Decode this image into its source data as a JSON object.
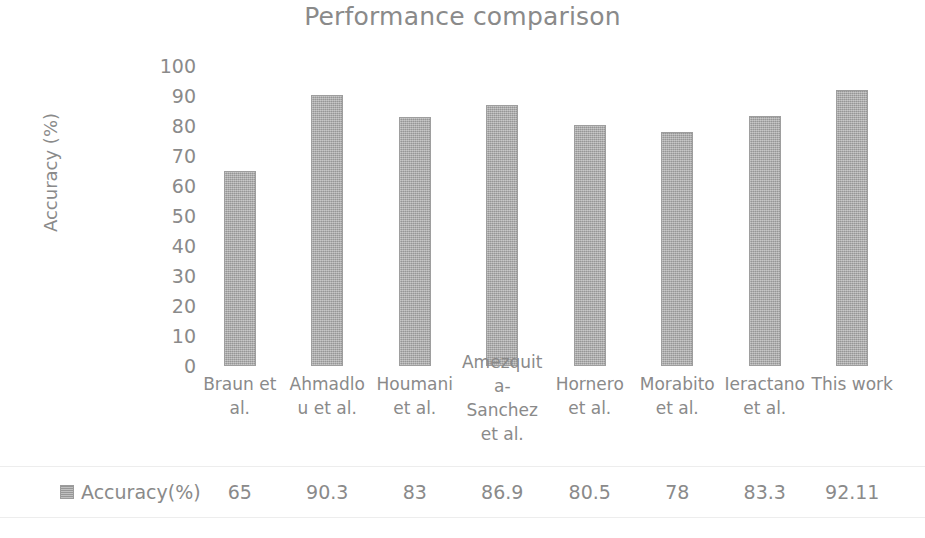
{
  "chart_data": {
    "type": "bar",
    "title": "Performance comparison",
    "xlabel": "",
    "ylabel": "Accuracy (%)",
    "ylim": [
      0,
      100
    ],
    "ytick_step": 10,
    "yticks": [
      "100",
      "90",
      "80",
      "70",
      "60",
      "50",
      "40",
      "30",
      "20",
      "10",
      "0"
    ],
    "grid": false,
    "legend_position": "bottom",
    "categories": [
      "Braun et al.",
      "Ahmadlou et al.",
      "Houmani et al.",
      "Amezquita-Sanchez et al.",
      "Hornero et al.",
      "Morabito et al.",
      "Ieractano et al.",
      "This work"
    ],
    "values": [
      65,
      90.3,
      83,
      86.9,
      80.5,
      78,
      83.3,
      92.11
    ],
    "value_labels": [
      "65",
      "90.3",
      "83",
      "86.9",
      "80.5",
      "78",
      "83.3",
      "92.11"
    ],
    "series": [
      {
        "name": "Accuracy(%)",
        "values": [
          65,
          90.3,
          83,
          86.9,
          80.5,
          78,
          83.3,
          92.11
        ]
      }
    ],
    "colors": {
      "bar_fill": "#ababab",
      "bar_border": "#9e9e9e",
      "text": "#8a8a8a",
      "background": "#ffffff",
      "table_rule": "#ededed"
    }
  },
  "legend": {
    "swatch_name": "accuracy-series-swatch",
    "label": "Accuracy(%)"
  }
}
